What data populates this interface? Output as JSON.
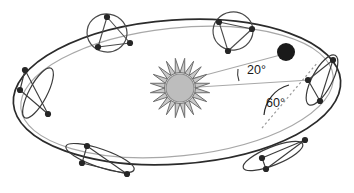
{
  "figure": {
    "background_color": "#ffffff",
    "type": "astronomical-orbit-diagram"
  },
  "colors": {
    "orbit_dark": "#2b2b2b",
    "orbit_light": "#a8a8a8",
    "orbit_mid": "#555555",
    "sun_core": "#bdbdbd",
    "sun_core_stroke": "#8a8a8a",
    "sun_rays": "#6e6e6e",
    "planet_body": "#1a1a1a",
    "node_dot": "#262626",
    "label_text": "#1a1a1a",
    "dotted_line": "#9a9a9a"
  },
  "annotations": {
    "angle_20": {
      "label": "20°",
      "value": 20,
      "unit": "degrees",
      "x": 247,
      "y": 74
    },
    "angle_60": {
      "label": "60°",
      "value": 60,
      "unit": "degrees",
      "x": 266,
      "y": 107
    }
  },
  "sun": {
    "name": "sun",
    "cx": 180,
    "cy": 88,
    "core_radius": 14,
    "ray_outer_radius": 30,
    "ray_count": 20
  },
  "planet": {
    "name": "planet-body",
    "cx": 286,
    "cy": 52,
    "radius": 9
  },
  "main_orbit": {
    "name": "main-elliptical-orbit",
    "cx": 177,
    "cy": 92,
    "rx": 164,
    "ry": 72,
    "rotation": -4
  },
  "secondary_orbit": {
    "name": "secondary-elliptical-orbit",
    "cx": 177,
    "cy": 92,
    "rx": 157,
    "ry": 64,
    "rotation": -6
  },
  "satellite_orbits": [
    {
      "name": "satellite-orbit-top-left",
      "cx": 107,
      "cy": 33,
      "rx": 20,
      "ry": 19,
      "rotation": 10,
      "stroke": "#4a4a4a",
      "nodes": [
        {
          "x": 107,
          "y": 17
        },
        {
          "x": 98,
          "y": 47
        },
        {
          "x": 130,
          "y": 43
        }
      ]
    },
    {
      "name": "satellite-orbit-top-center",
      "cx": 233,
      "cy": 31,
      "rx": 20,
      "ry": 19,
      "rotation": -8,
      "stroke": "#4a4a4a",
      "nodes": [
        {
          "x": 219,
          "y": 22
        },
        {
          "x": 252,
          "y": 29
        },
        {
          "x": 228,
          "y": 51
        }
      ]
    },
    {
      "name": "satellite-orbit-right",
      "cx": 322,
      "cy": 80,
      "rx": 10,
      "ry": 28,
      "rotation": 28,
      "stroke": "#3a3a3a",
      "nodes": [
        {
          "x": 333,
          "y": 60
        },
        {
          "x": 308,
          "y": 80
        },
        {
          "x": 320,
          "y": 101
        }
      ]
    },
    {
      "name": "satellite-orbit-left",
      "cx": 38,
      "cy": 93,
      "rx": 9,
      "ry": 28,
      "rotation": 28,
      "stroke": "#3a3a3a",
      "nodes": [
        {
          "x": 25,
          "y": 70
        },
        {
          "x": 20,
          "y": 90
        },
        {
          "x": 48,
          "y": 114
        }
      ]
    },
    {
      "name": "satellite-orbit-bottom-left",
      "cx": 100,
      "cy": 158,
      "rx": 36,
      "ry": 9,
      "rotation": 19,
      "stroke": "#3a3a3a",
      "nodes": [
        {
          "x": 87,
          "y": 146
        },
        {
          "x": 82,
          "y": 163
        },
        {
          "x": 127,
          "y": 174
        }
      ]
    },
    {
      "name": "satellite-orbit-bottom-right",
      "cx": 273,
      "cy": 156,
      "rx": 32,
      "ry": 9,
      "rotation": -22,
      "stroke": "#3a3a3a",
      "nodes": [
        {
          "x": 305,
          "y": 140
        },
        {
          "x": 262,
          "y": 158
        },
        {
          "x": 266,
          "y": 169
        }
      ]
    }
  ],
  "radial_lines": [
    {
      "name": "radial-line-to-planet",
      "x1": 183,
      "y1": 81,
      "x2": 288,
      "y2": 53
    },
    {
      "name": "radial-line-horizontal",
      "x1": 183,
      "y1": 88,
      "x2": 310,
      "y2": 80
    }
  ],
  "dotted_line": {
    "name": "dotted-reference-line",
    "x1": 262,
    "y1": 128,
    "x2": 318,
    "y2": 62
  }
}
